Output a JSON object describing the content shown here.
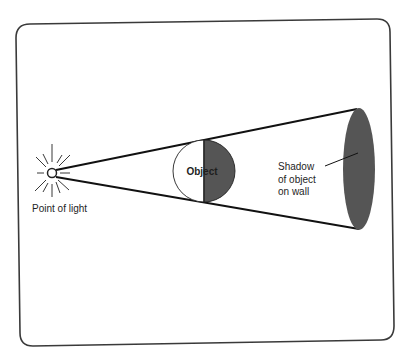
{
  "diagram": {
    "type": "shadow-formation",
    "colors": {
      "background": "#ffffff",
      "frame_stroke": "#3a3a3a",
      "line": "#111111",
      "shadow_fill": "#555555",
      "object_dark_half": "#555555",
      "object_light_half": "#ffffff",
      "text": "#1e1e1e"
    },
    "labels": {
      "light_source": "Point of light",
      "object": "Object",
      "shadow_line1": "Shadow",
      "shadow_line2": "of object",
      "shadow_line3": "on wall"
    },
    "elements": [
      {
        "id": "light-source",
        "description": "small circle with radiating rays"
      },
      {
        "id": "light-cone",
        "description": "two straight lines from light source to wall"
      },
      {
        "id": "object",
        "description": "sphere, left half lit (white), right half dark"
      },
      {
        "id": "shadow",
        "description": "dark ellipse on the wall"
      }
    ]
  }
}
